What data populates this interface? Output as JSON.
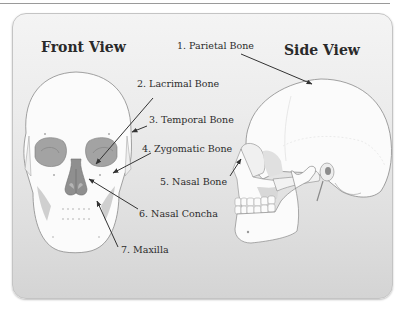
{
  "diagram": {
    "front_view_title": "Front View",
    "side_view_title": "Side View",
    "labels": [
      {
        "number": "1.",
        "name": "Parietal Bone",
        "text": "1. Parietal Bone"
      },
      {
        "number": "2.",
        "name": "Lacrimal Bone",
        "text": "2. Lacrimal Bone"
      },
      {
        "number": "3.",
        "name": "Temporal Bone",
        "text": "3. Temporal Bone"
      },
      {
        "number": "4.",
        "name": "Zygomatic Bone",
        "text": "4. Zygomatic Bone"
      },
      {
        "number": "5.",
        "name": "Nasal Bone",
        "text": "5. Nasal Bone"
      },
      {
        "number": "6.",
        "name": "Nasal Concha",
        "text": "6. Nasal Concha"
      },
      {
        "number": "7.",
        "name": "Maxilla",
        "text": "7. Maxilla"
      }
    ],
    "colors": {
      "panel_top": "#f4f4f4",
      "panel_bottom": "#d4d4d4",
      "bone": "#fbfbfb",
      "bone_outline": "#8a8a8a",
      "orbit": "#9c9c9c",
      "text": "#2c2c2c",
      "arrow": "#333333"
    }
  }
}
